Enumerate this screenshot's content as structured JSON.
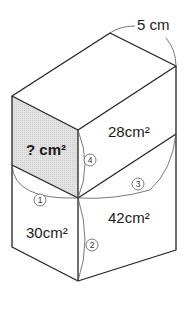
{
  "diagram": {
    "type": "rectangular-prism-net-problem",
    "dimension_label": "5 cm",
    "faces": [
      {
        "id": "unknown",
        "label": "? cm²",
        "shaded": true,
        "fill": "#dcdcdc"
      },
      {
        "id": "top-right",
        "label": "28cm²"
      },
      {
        "id": "bottom-left",
        "label": "30cm²"
      },
      {
        "id": "bottom-right",
        "label": "42cm²"
      }
    ],
    "edge_markers": [
      "①",
      "②",
      "③",
      "④"
    ]
  }
}
